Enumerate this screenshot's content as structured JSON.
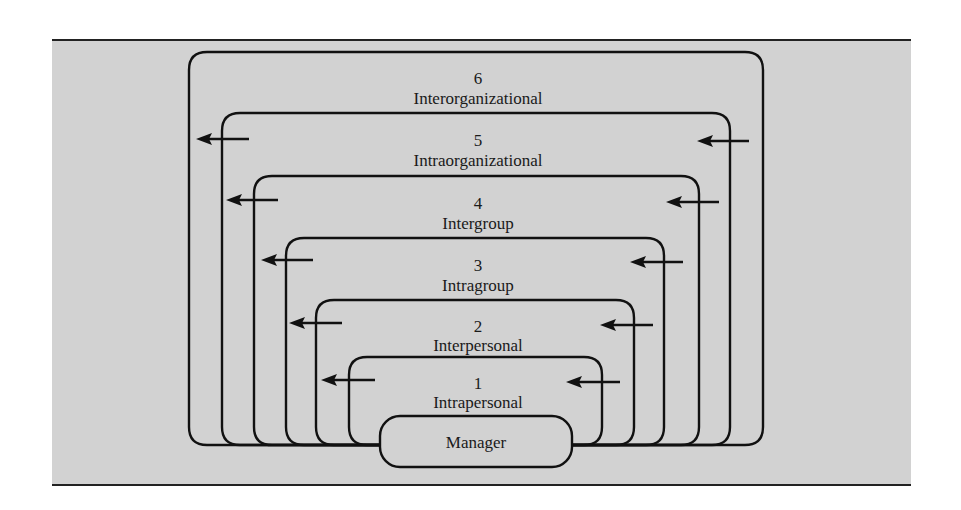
{
  "diagram": {
    "center": {
      "label": "Manager"
    },
    "levels": [
      {
        "number": "1",
        "label": "Intrapersonal"
      },
      {
        "number": "2",
        "label": "Interpersonal"
      },
      {
        "number": "3",
        "label": "Intragroup"
      },
      {
        "number": "4",
        "label": "Intergroup"
      },
      {
        "number": "5",
        "label": "Intraorganizational"
      },
      {
        "number": "6",
        "label": "Interorganizational"
      }
    ],
    "arrow_direction": "inward-to-outward (leftward arrows on both sides)",
    "colors": {
      "background": "#d2d2d2",
      "stroke": "#111111",
      "text": "#1a1a1a"
    }
  }
}
